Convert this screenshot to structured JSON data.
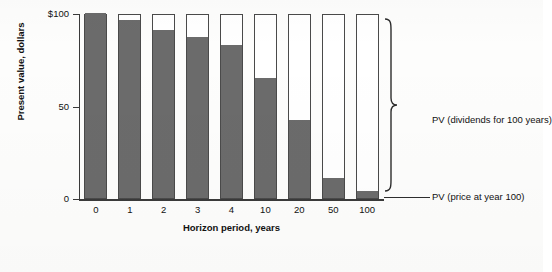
{
  "chart_data": {
    "type": "bar",
    "title": "",
    "subtitle": "",
    "xlabel": "Horizon period, years",
    "ylabel": "Present value, dollars",
    "categories": [
      "0",
      "1",
      "2",
      "3",
      "4",
      "10",
      "20",
      "50",
      "100"
    ],
    "ylim": [
      0,
      100
    ],
    "y_ticks": [
      0,
      50,
      100
    ],
    "y_tick_labels": [
      "0",
      "50",
      "$100"
    ],
    "grid": false,
    "stacked": true,
    "legend_position": "right-bracket-annotations",
    "series": [
      {
        "name": "PV (price at year 100)",
        "color": "#6b6b6b",
        "values": [
          100,
          96,
          91,
          87,
          83,
          65,
          42,
          11,
          4
        ]
      },
      {
        "name": "PV (dividends for 100 years)",
        "color": "#ffffff",
        "values": [
          0,
          4,
          9,
          13,
          17,
          35,
          58,
          89,
          96
        ]
      }
    ],
    "annotations": [
      {
        "id": "bracket-dividends",
        "text": "PV (dividends for 100 years)"
      },
      {
        "id": "leader-price",
        "text": "PV (price at year 100)"
      }
    ],
    "total_value": 100
  },
  "axes": {
    "y": {
      "title": "Present value, dollars",
      "ticks": [
        {
          "label": "$100",
          "value": 100
        },
        {
          "label": "50",
          "value": 50
        },
        {
          "label": "0",
          "value": 0
        }
      ]
    },
    "x": {
      "title": "Horizon period, years",
      "ticks": [
        "0",
        "1",
        "2",
        "3",
        "4",
        "10",
        "20",
        "50",
        "100"
      ]
    }
  },
  "annotations": {
    "dividends_label": "PV (dividends for 100 years)",
    "price_label": "PV (price at year 100)"
  },
  "colors": {
    "fill": "#6b6b6b",
    "empty": "#ffffff",
    "stroke": "#4a4a4a",
    "axis": "#3a3a3a",
    "text": "#111111",
    "background": "#fdfdfc"
  }
}
